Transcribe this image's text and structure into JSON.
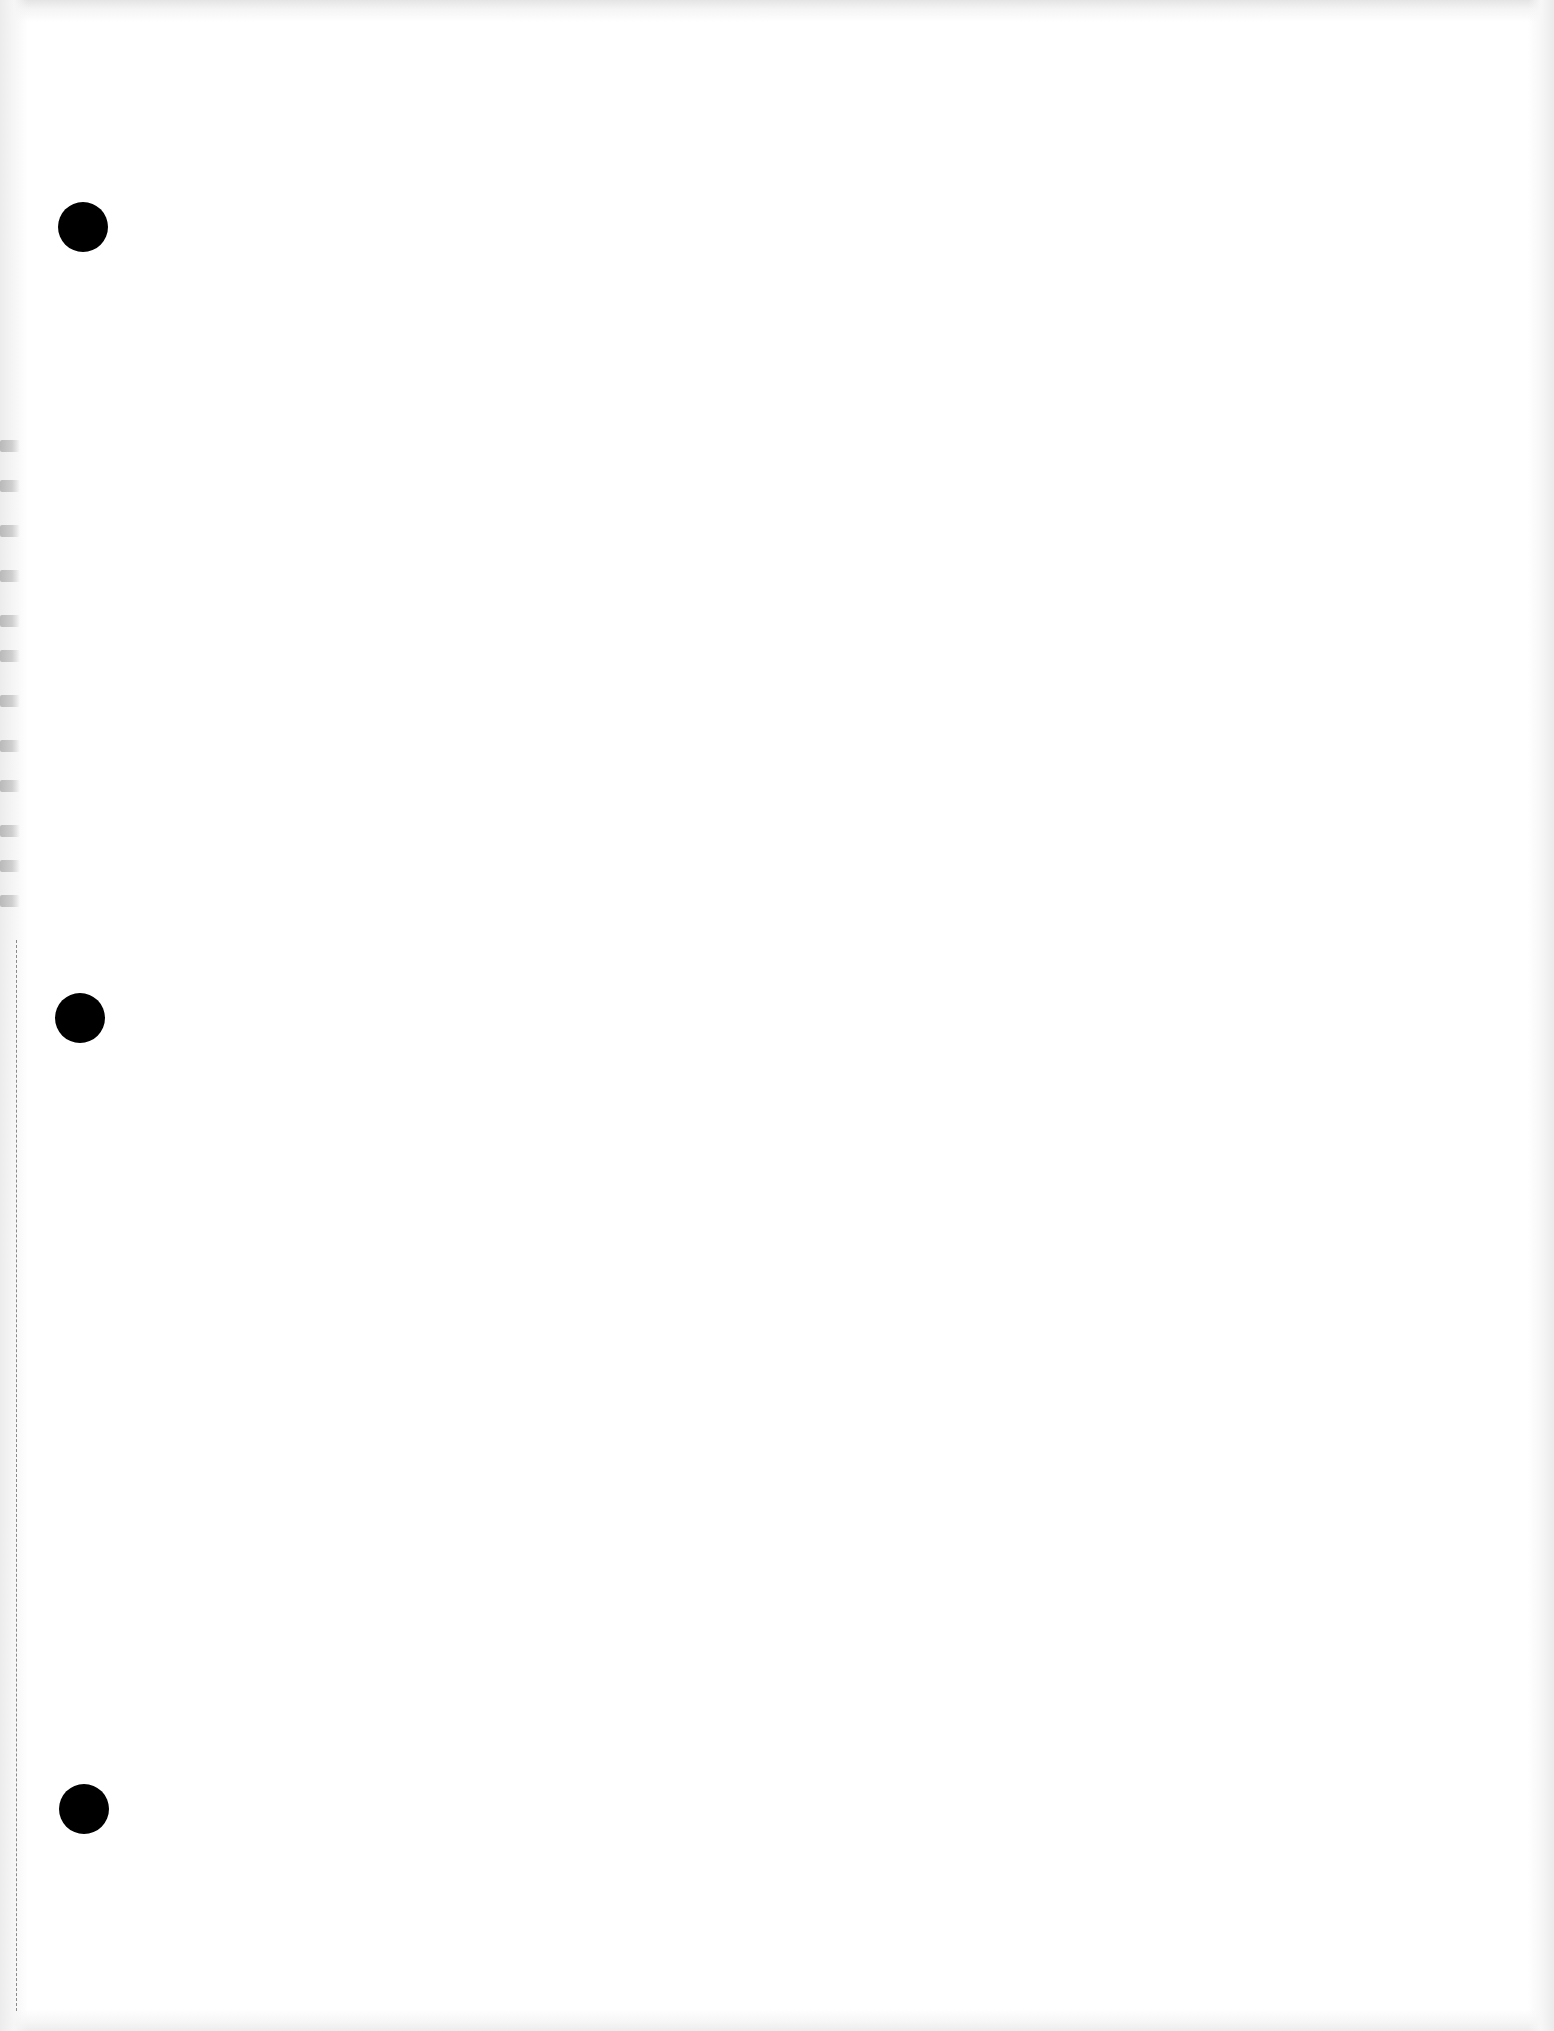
{
  "document": {
    "type": "blank scanned sheet",
    "background_color": "#ffffff",
    "text_content": ""
  },
  "holes": [
    {
      "label": "top-hole",
      "cx": 83,
      "cy": 227,
      "r": 25,
      "color": "#000000"
    },
    {
      "label": "middle-hole",
      "cx": 80,
      "cy": 1018,
      "r": 25,
      "color": "#000000"
    },
    {
      "label": "bottom-hole",
      "cx": 84,
      "cy": 1809,
      "r": 25,
      "color": "#000000"
    }
  ],
  "perforation": {
    "x": 16,
    "style": "dashed",
    "color": "#8a8a8a"
  },
  "smudge_offsets": [
    0,
    40,
    85,
    130,
    175,
    210,
    255,
    300,
    340,
    385,
    420,
    455
  ]
}
